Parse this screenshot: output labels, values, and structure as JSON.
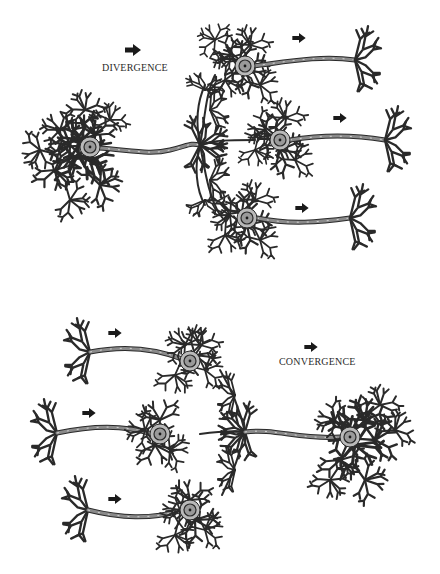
{
  "diagram": {
    "type": "neuron-circuit-illustration",
    "panels": [
      {
        "id": "divergence",
        "label": "DIVERGENCE",
        "description": "One presynaptic neuron's axon branches to contact three postsynaptic neurons",
        "source_neurons": 1,
        "target_neurons": 3,
        "direction_arrows": 4
      },
      {
        "id": "convergence",
        "label": "CONVERGENCE",
        "description": "Three presynaptic neurons send axons that converge onto one postsynaptic neuron",
        "source_neurons": 3,
        "target_neurons": 1,
        "direction_arrows": 4
      }
    ],
    "colors": {
      "background": "#ffffff",
      "stroke": "#2a2a2a",
      "axon_fill": "#8a8a8a",
      "soma_fill": "#b9b9b9",
      "nucleus_fill": "#9a9a9a",
      "arrow": "#1a1a1a",
      "text": "#2b2b2b"
    },
    "icons": {
      "arrow": "right-arrow-icon"
    }
  }
}
